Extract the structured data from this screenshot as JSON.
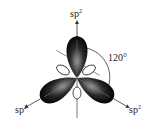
{
  "diagram": {
    "labels": {
      "top": {
        "base": "sp",
        "sup": "2"
      },
      "left": {
        "base": "sp",
        "sup": "2"
      },
      "right": {
        "base": "sp",
        "sup": "2"
      },
      "angle": "120°"
    },
    "colors": {
      "lobe_dark": "#0a0a0a",
      "lobe_light": "#9a9a9a",
      "line": "#333333"
    }
  }
}
